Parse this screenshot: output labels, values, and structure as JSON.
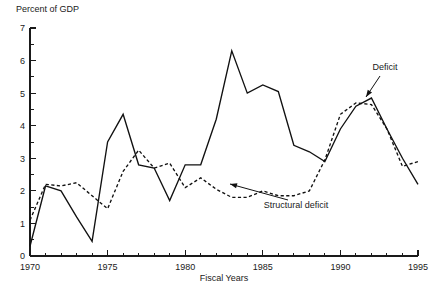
{
  "chart_data": {
    "type": "line",
    "title": "",
    "ylabel": "Percent of GDP",
    "xlabel": "Fiscal Years",
    "xlim": [
      1970,
      1995
    ],
    "ylim": [
      0,
      7
    ],
    "grid": false,
    "legend_position": "inline-annotations",
    "y_ticks_major": [
      0,
      1,
      2,
      3,
      4,
      5,
      6,
      7
    ],
    "y_tick_labels": [
      "0",
      "1",
      "2",
      "3",
      "4",
      "5",
      "6",
      "7"
    ],
    "y_ticks_minor": [
      0.5,
      1.5,
      2.5,
      3.5,
      4.5,
      5.5,
      6.5
    ],
    "x_ticks_major": [
      1970,
      1975,
      1980,
      1985,
      1990,
      1995
    ],
    "x_tick_labels": [
      "1970",
      "1975",
      "1980",
      "1985",
      "1990",
      "1995"
    ],
    "x_ticks_minor": [
      1971,
      1972,
      1973,
      1974,
      1976,
      1977,
      1978,
      1979,
      1981,
      1982,
      1983,
      1984,
      1986,
      1987,
      1988,
      1989,
      1991,
      1992,
      1993,
      1994
    ],
    "x": [
      1970,
      1971,
      1972,
      1973,
      1974,
      1975,
      1976,
      1977,
      1978,
      1979,
      1980,
      1981,
      1982,
      1983,
      1984,
      1985,
      1986,
      1987,
      1988,
      1989,
      1990,
      1991,
      1992,
      1993,
      1994,
      1995
    ],
    "series": [
      {
        "name": "Deficit",
        "style": "solid",
        "values": [
          0.3,
          2.15,
          2.0,
          1.2,
          0.45,
          3.5,
          4.35,
          2.8,
          2.7,
          1.7,
          2.8,
          2.8,
          4.2,
          6.3,
          5.0,
          5.25,
          5.05,
          3.4,
          3.2,
          2.9,
          3.9,
          4.6,
          4.85,
          3.9,
          3.0,
          2.2
        ]
      },
      {
        "name": "Structural deficit",
        "style": "dashed",
        "values": [
          1.1,
          2.2,
          2.15,
          2.25,
          1.85,
          1.45,
          2.6,
          3.25,
          2.7,
          2.85,
          2.1,
          2.4,
          2.05,
          1.8,
          1.8,
          2.0,
          1.85,
          1.85,
          2.0,
          2.95,
          4.35,
          4.7,
          4.65,
          3.9,
          2.75,
          2.9
        ]
      }
    ],
    "annotations": [
      {
        "name": "deficit",
        "text": "Deficit",
        "text_x": 385,
        "text_y": 70,
        "leader_from_x": 380,
        "leader_from_y": 76,
        "leader_to_x": 366,
        "leader_to_y": 97
      },
      {
        "name": "structural-deficit",
        "text": "Structural deficit",
        "text_x": 296,
        "text_y": 208,
        "leader_from_x": 288,
        "leader_from_y": 200,
        "leader_to_x": 230,
        "leader_to_y": 184
      }
    ]
  },
  "plot_geometry": {
    "left": 30,
    "right": 418,
    "top": 28,
    "bottom": 256
  }
}
